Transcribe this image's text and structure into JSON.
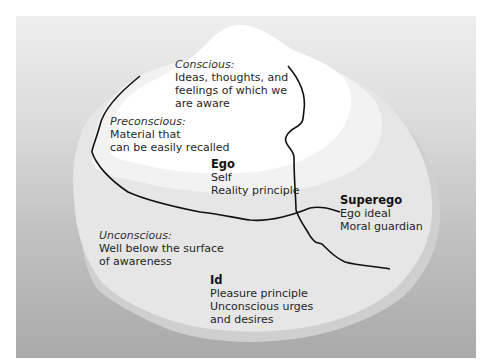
{
  "diagram": {
    "colors": {
      "background_top": "#eeeeee",
      "background_bottom": "#a9a9a9",
      "iceberg_top": "#ffffff",
      "iceberg_mid": "#f2f2f2",
      "iceberg_base": "#e6e6e6",
      "iceberg_shadow": "#cfcfcf",
      "boundary_line": "#111111"
    },
    "regions": {
      "conscious": {
        "title": "Conscious:",
        "lines": [
          "Ideas, thoughts, and",
          "feelings of which we",
          "are aware"
        ]
      },
      "preconscious": {
        "title": "Preconscious:",
        "lines": [
          "Material that",
          "can be easily recalled"
        ]
      },
      "unconscious": {
        "title": "Unconscious:",
        "lines": [
          "Well below the surface",
          "of awareness"
        ]
      }
    },
    "structures": {
      "ego": {
        "title": "Ego",
        "lines": [
          "Self",
          "Reality principle"
        ]
      },
      "superego": {
        "title": "Superego",
        "lines": [
          "Ego ideal",
          "Moral guardian"
        ]
      },
      "id": {
        "title": "Id",
        "lines": [
          "Pleasure principle",
          "Unconscious urges",
          "and desires"
        ]
      }
    }
  }
}
